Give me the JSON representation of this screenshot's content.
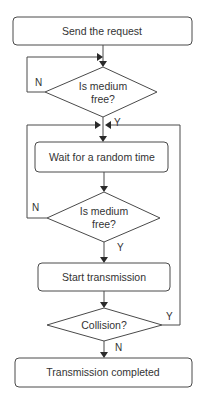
{
  "flowchart": {
    "nodes": [
      {
        "id": "send",
        "type": "process",
        "label": "Send the request"
      },
      {
        "id": "check1",
        "type": "decision",
        "label_line1": "Is medium",
        "label_line2": "free?"
      },
      {
        "id": "wait",
        "type": "process",
        "label": "Wait for a random time"
      },
      {
        "id": "check2",
        "type": "decision",
        "label_line1": "Is medium",
        "label_line2": "free?"
      },
      {
        "id": "start",
        "type": "process",
        "label": "Start transmission"
      },
      {
        "id": "collision",
        "type": "decision",
        "label": "Collision?"
      },
      {
        "id": "done",
        "type": "process",
        "label": "Transmission completed"
      }
    ],
    "edge_labels": {
      "check1_no": "N",
      "check1_yes": "Y",
      "check2_no": "N",
      "check2_yes": "Y",
      "collision_yes": "Y",
      "collision_no": "N"
    }
  }
}
